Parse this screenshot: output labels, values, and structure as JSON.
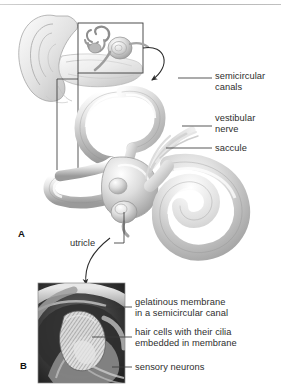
{
  "figure": {
    "background": "#ffffff",
    "line_color": "#3a3a3a",
    "text_color": "#2e2e2e"
  },
  "panels": [
    {
      "id": "A",
      "letter": "A",
      "x": 18,
      "y": 228
    },
    {
      "id": "B",
      "letter": "B",
      "x": 20,
      "y": 360
    }
  ],
  "labels": {
    "semicircular_canals": "semicircular\ncanals",
    "vestibular_nerve": "vestibular\nnerve",
    "saccule": "saccule",
    "utricle": "utricle",
    "gelatinous_membrane": "gelatinous membrane\nin a semicircular canal",
    "hair_cells": "hair cells with their cilia\nembedded in membrane",
    "sensory_neurons": "sensory neurons"
  },
  "structures": [
    "outer ear pinna",
    "ear canal",
    "bony labyrinth inset",
    "anterior semicircular canal",
    "posterior semicircular canal",
    "lateral semicircular canal",
    "ampulla",
    "vestibule",
    "cochlea",
    "vestibular nerve",
    "cupula",
    "crista ampullaris",
    "hair cells",
    "sensory neuron fibers"
  ],
  "inset_box": {
    "x": 78,
    "y": 23,
    "width": 65,
    "height": 50
  },
  "panel_b_box": {
    "x": 38,
    "y": 283,
    "width": 87,
    "height": 100
  }
}
